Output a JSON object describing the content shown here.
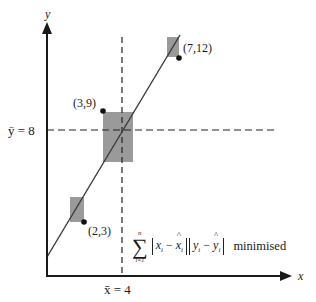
{
  "diagram": {
    "axes": {
      "x_label": "x",
      "y_label": "y"
    },
    "mean_lines": {
      "x_mean_label": "x̄ = 4",
      "y_mean_label": "ȳ = 8",
      "x_mean_value": 4,
      "y_mean_value": 8
    },
    "points": [
      {
        "label": "(3,9)",
        "x": 3,
        "y": 9
      },
      {
        "label": "(7,12)",
        "x": 7,
        "y": 12
      },
      {
        "label": "(2,3)",
        "x": 2,
        "y": 3
      }
    ],
    "formula": {
      "upper": "n",
      "lower": "i=1",
      "sum_symbol": "∑",
      "term1_var": "x",
      "term1_hat": "x",
      "term2_var": "y",
      "term2_hat": "y",
      "sub": "i",
      "minus": "−",
      "suffix": "minimised"
    },
    "colors": {
      "rect_fill": "#9a9a9a",
      "line": "#3a3a3a",
      "axis": "#1a1a1a"
    }
  }
}
